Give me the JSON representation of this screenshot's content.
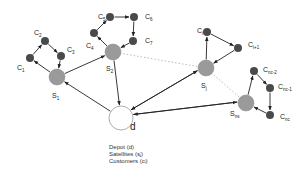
{
  "diagram": {
    "type": "two-echelon vehicle routing network",
    "colors": {
      "satellite": "#9a9a9a",
      "customer": "#4a4a4a",
      "depot": "#ffffff",
      "edge": "#222222",
      "dotted": "#aaaaaa"
    },
    "depot": {
      "label": "d",
      "x": 121,
      "y": 118,
      "r": 12
    },
    "satellites": [
      {
        "id": "s1",
        "label": "S",
        "sub": "1",
        "x": 57,
        "y": 77,
        "lx": 52,
        "ly": 98
      },
      {
        "id": "s2",
        "label": "S",
        "sub": "2",
        "x": 113,
        "y": 52,
        "lx": 106,
        "ly": 71
      },
      {
        "id": "sj",
        "label": "S",
        "sub": "j",
        "x": 206,
        "y": 68,
        "lx": 201,
        "ly": 88
      },
      {
        "id": "sns",
        "label": "S",
        "sub": "ns",
        "x": 246,
        "y": 103,
        "lx": 230,
        "ly": 116
      }
    ],
    "customers": [
      {
        "id": "c1",
        "label": "C",
        "sub": "1",
        "x": 30,
        "y": 58,
        "lx": 17,
        "ly": 70
      },
      {
        "id": "c2",
        "label": "C",
        "sub": "2",
        "x": 45,
        "y": 41,
        "lx": 34,
        "ly": 35
      },
      {
        "id": "c3",
        "label": "C",
        "sub": "3",
        "x": 61,
        "y": 56,
        "lx": 67,
        "ly": 52
      },
      {
        "id": "c4",
        "label": "C",
        "sub": "4",
        "x": 94,
        "y": 33,
        "lx": 86,
        "ly": 48
      },
      {
        "id": "c5",
        "label": "C",
        "sub": "5",
        "x": 110,
        "y": 17,
        "lx": 98,
        "ly": 19
      },
      {
        "id": "c6",
        "label": "C",
        "sub": "6",
        "x": 134,
        "y": 17,
        "lx": 145,
        "ly": 19
      },
      {
        "id": "c7",
        "label": "C",
        "sub": "7",
        "x": 133,
        "y": 41,
        "lx": 145,
        "ly": 43
      },
      {
        "id": "ci",
        "label": "C",
        "sub": "i",
        "x": 207,
        "y": 32,
        "lx": 197,
        "ly": 33
      },
      {
        "id": "ci1",
        "label": "C",
        "sub": "i+1",
        "x": 238,
        "y": 48,
        "lx": 248,
        "ly": 47
      },
      {
        "id": "cnc2",
        "label": "C",
        "sub": "nc-2",
        "x": 254,
        "y": 71,
        "lx": 263,
        "ly": 72
      },
      {
        "id": "cnc1",
        "label": "C",
        "sub": "nc-1",
        "x": 270,
        "y": 88,
        "lx": 278,
        "ly": 89
      },
      {
        "id": "cnc",
        "label": "C",
        "sub": "nc",
        "x": 270,
        "y": 115,
        "lx": 280,
        "ly": 119
      }
    ],
    "edges": [
      {
        "from": "s1",
        "to": "c1"
      },
      {
        "from": "c1",
        "to": "c2"
      },
      {
        "from": "c2",
        "to": "c3"
      },
      {
        "from": "c3",
        "to": "s1"
      },
      {
        "from": "s2",
        "to": "c4"
      },
      {
        "from": "c4",
        "to": "c5"
      },
      {
        "from": "c5",
        "to": "c6"
      },
      {
        "from": "c6",
        "to": "c7"
      },
      {
        "from": "c7",
        "to": "s2"
      },
      {
        "from": "sj",
        "to": "ci"
      },
      {
        "from": "ci",
        "to": "ci1"
      },
      {
        "from": "ci1",
        "to": "sj"
      },
      {
        "from": "sns",
        "to": "cnc2"
      },
      {
        "from": "cnc2",
        "to": "cnc1"
      },
      {
        "from": "cnc1",
        "to": "cnc"
      },
      {
        "from": "cnc",
        "to": "sns"
      },
      {
        "from": "s1",
        "to": "s2"
      },
      {
        "from": "s2",
        "to": "d"
      },
      {
        "from": "d",
        "to": "s1"
      },
      {
        "from": "d",
        "to": "sj",
        "offset": -2
      },
      {
        "from": "sj",
        "to": "d",
        "offset": 2
      },
      {
        "from": "d",
        "to": "sns",
        "offset": -2
      },
      {
        "from": "sns",
        "to": "d",
        "offset": 2
      }
    ],
    "dotted_edges": [
      {
        "from": "s2",
        "to": "sj"
      },
      {
        "from": "sj",
        "to": "sns"
      }
    ]
  },
  "legend": {
    "depot": "Depot (d)",
    "satellites": "Satellites (sⱼ)",
    "customers": "Customers (cᵢ)"
  }
}
